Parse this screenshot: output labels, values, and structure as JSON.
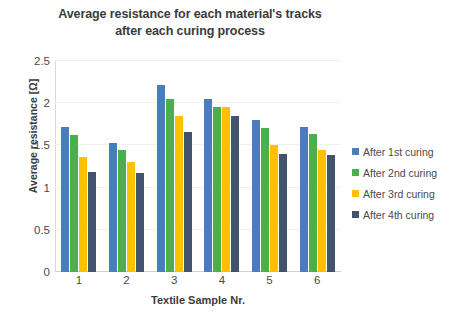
{
  "chart_data": {
    "type": "bar",
    "title": "Average resistance for each material's tracks after each curing process",
    "title_lines": [
      "Average resistance for each material's tracks",
      "after each curing process"
    ],
    "xlabel": "Textile Sample Nr.",
    "ylabel": "Average resistance [Ω]",
    "categories": [
      "1",
      "2",
      "3",
      "4",
      "5",
      "6"
    ],
    "ylim": [
      0,
      2.5
    ],
    "yticks": [
      "0",
      "0.5",
      "1",
      "1.5",
      "2",
      "2.5"
    ],
    "ytick_values": [
      0,
      0.5,
      1,
      1.5,
      2,
      2.5
    ],
    "grid": true,
    "legend_position": "right",
    "series": [
      {
        "name": "After 1st curing",
        "color": "#4a7ebb",
        "values": [
          1.72,
          1.53,
          2.22,
          2.05,
          1.8,
          1.72
        ]
      },
      {
        "name": "After 2nd curing",
        "color": "#4cae4c",
        "values": [
          1.62,
          1.44,
          2.05,
          1.96,
          1.71,
          1.63
        ]
      },
      {
        "name": "After 3rd curing",
        "color": "#ffc000",
        "values": [
          1.36,
          1.3,
          1.85,
          1.96,
          1.5,
          1.45
        ]
      },
      {
        "name": "After 4th curing",
        "color": "#41536d",
        "values": [
          1.19,
          1.17,
          1.66,
          1.85,
          1.4,
          1.39
        ]
      }
    ]
  }
}
